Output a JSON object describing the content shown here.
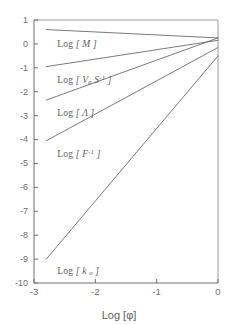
{
  "figure": {
    "background_color": "#ffffff",
    "line_color": "#6b6b6b",
    "axis_color": "#6e6e6e",
    "text_color": "#5c5c5c"
  },
  "axes": {
    "x_title": "Log [φ]",
    "y_title": "",
    "x_ticks": [
      "-3",
      "-2",
      "-1",
      "0"
    ],
    "y_ticks": [
      "1",
      "0",
      "-1",
      "-2",
      "-3",
      "-4",
      "-5",
      "-6",
      "-7",
      "-8",
      "-9",
      "-10"
    ]
  },
  "curve_labels": [
    {
      "prefix": "Log [ ",
      "symbol": "M",
      "sub": "",
      "sup": "",
      "suffix": " ]",
      "full": "Log [ M ]"
    },
    {
      "prefix": "Log [ ",
      "symbol": "V",
      "sub": "p",
      "sup": "",
      "second_symbol": "S",
      "second_sup": "-1",
      "suffix": " ]",
      "full": "Log [ Vp S-1 ]"
    },
    {
      "prefix": "Log [ ",
      "symbol": "Λ",
      "sub": "",
      "sup": "",
      "suffix": " ]",
      "full": "Log [ Λ ]"
    },
    {
      "prefix": "Log [ ",
      "symbol": "F",
      "sub": "",
      "sup": "-1",
      "suffix": " ]",
      "full": "Log [ F-1 ]"
    },
    {
      "prefix": "Log [ ",
      "symbol": "k",
      "sub": "o",
      "sup": "",
      "suffix": " ]",
      "full": "Log [ k o ]"
    }
  ],
  "chart_data": {
    "type": "line",
    "title": "",
    "xlabel": "Log [φ]",
    "ylabel": "",
    "xlim": [
      -3,
      0
    ],
    "ylim": [
      -10,
      1
    ],
    "xticks": [
      -3,
      -2,
      -1,
      0
    ],
    "yticks": [
      1,
      0,
      -1,
      -2,
      -3,
      -4,
      -5,
      -6,
      -7,
      -8,
      -9,
      -10
    ],
    "grid": false,
    "legend": "inline-labels",
    "series": [
      {
        "name": "Log [ M ]",
        "x": [
          -2.8,
          0.0
        ],
        "y": [
          0.6,
          0.25
        ],
        "slope": -0.125,
        "label_x": -2.62,
        "label_y": -0.05
      },
      {
        "name": "Log [ Vp S^-1 ]",
        "x": [
          -2.8,
          0.0
        ],
        "y": [
          -0.95,
          0.15
        ],
        "slope": 0.393,
        "label_x": -2.62,
        "label_y": -1.52
      },
      {
        "name": "Log [ Λ ]",
        "x": [
          -2.8,
          0.0
        ],
        "y": [
          -2.35,
          0.25
        ],
        "slope": 0.929,
        "label_x": -2.62,
        "label_y": -2.92
      },
      {
        "name": "Log [ F^-1 ]",
        "x": [
          -2.8,
          0.0
        ],
        "y": [
          -4.05,
          -0.15
        ],
        "slope": 1.393,
        "label_x": -2.62,
        "label_y": -4.62
      },
      {
        "name": "Log [ k o ]",
        "x": [
          -2.8,
          0.0
        ],
        "y": [
          -9.0,
          -0.5
        ],
        "slope": 3.036,
        "label_x": -2.62,
        "label_y": -9.55
      }
    ]
  }
}
